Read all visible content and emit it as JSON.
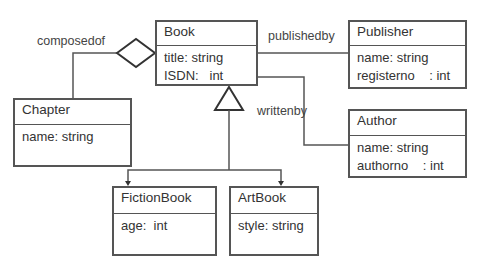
{
  "diagram": {
    "type": "uml-class-diagram",
    "classes": [
      {
        "id": "book",
        "name": "Book",
        "attributes": [
          "title: string",
          "ISDN:   int"
        ]
      },
      {
        "id": "publisher",
        "name": "Publisher",
        "attributes": [
          "name: string",
          "registerno    : int"
        ]
      },
      {
        "id": "author",
        "name": "Author",
        "attributes": [
          "name: string",
          "authorno    : int"
        ]
      },
      {
        "id": "chapter",
        "name": "Chapter",
        "attributes": [
          "name: string"
        ]
      },
      {
        "id": "fictionbook",
        "name": "FictionBook",
        "attributes": [
          "age:  int"
        ]
      },
      {
        "id": "artbook",
        "name": "ArtBook",
        "attributes": [
          "style: string"
        ]
      }
    ],
    "relations": [
      {
        "type": "aggregation",
        "from": "Book",
        "to": "Chapter",
        "label": "composedof"
      },
      {
        "type": "association",
        "from": "Book",
        "to": "Publisher",
        "label": "publishedby"
      },
      {
        "type": "association",
        "from": "Book",
        "to": "Author",
        "label": "writtenby"
      },
      {
        "type": "generalization",
        "parent": "Book",
        "children": [
          "FictionBook",
          "ArtBook"
        ]
      }
    ]
  },
  "labels": {
    "composedof": "composedof",
    "publishedby": "publishedby",
    "writtenby": "writtenby"
  },
  "colors": {
    "line": "#555555",
    "text": "#333333",
    "background": "#ffffff"
  }
}
